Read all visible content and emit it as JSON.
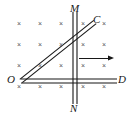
{
  "figure": {
    "type": "physics-diagram",
    "width": 135,
    "height": 120,
    "background_color": "#ffffff",
    "line_color": "#171717",
    "field_mark_color": "#555555"
  },
  "labels": [
    {
      "id": "M",
      "text": "M",
      "x": 70,
      "y": 3
    },
    {
      "id": "C",
      "text": "C",
      "x": 93,
      "y": 14
    },
    {
      "id": "O",
      "text": "O",
      "x": 7,
      "y": 74
    },
    {
      "id": "D",
      "text": "D",
      "x": 118,
      "y": 74
    },
    {
      "id": "N",
      "text": "N",
      "x": 70,
      "y": 103
    }
  ],
  "rails": {
    "vertical": {
      "name": "rail-MN",
      "from": {
        "x": 75,
        "y": 12
      },
      "to": {
        "x": 75,
        "y": 104
      },
      "style": "double-line",
      "gap": 4
    },
    "horizontal": {
      "name": "rail-OD",
      "from": {
        "x": 21,
        "y": 81
      },
      "to": {
        "x": 117,
        "y": 81
      },
      "style": "double-line",
      "gap": 4
    }
  },
  "rod": {
    "name": "rod-OC",
    "from": {
      "x": 21,
      "y": 81
    },
    "to": {
      "x": 95,
      "y": 22
    },
    "style": "double-line",
    "gap": 4
  },
  "velocity_arrow": {
    "name": "velocity-arrow",
    "from": {
      "x": 79,
      "y": 58
    },
    "to": {
      "x": 114,
      "y": 58
    },
    "direction": "right"
  },
  "field": {
    "symbol": "×",
    "meaning": "magnetic field into the page",
    "columns_x": [
      20,
      41,
      62,
      84,
      105
    ],
    "rows_y": [
      24,
      45,
      66,
      87
    ],
    "marks": [
      {
        "x": 20,
        "y": 24
      },
      {
        "x": 41,
        "y": 24
      },
      {
        "x": 62,
        "y": 24
      },
      {
        "x": 84,
        "y": 24
      },
      {
        "x": 105,
        "y": 24
      },
      {
        "x": 20,
        "y": 45
      },
      {
        "x": 41,
        "y": 45
      },
      {
        "x": 62,
        "y": 45
      },
      {
        "x": 84,
        "y": 45
      },
      {
        "x": 105,
        "y": 45
      },
      {
        "x": 20,
        "y": 66
      },
      {
        "x": 41,
        "y": 66
      },
      {
        "x": 62,
        "y": 66
      },
      {
        "x": 84,
        "y": 66
      },
      {
        "x": 105,
        "y": 66
      },
      {
        "x": 20,
        "y": 87
      },
      {
        "x": 41,
        "y": 87
      },
      {
        "x": 62,
        "y": 87
      },
      {
        "x": 84,
        "y": 87
      },
      {
        "x": 105,
        "y": 87
      }
    ]
  }
}
